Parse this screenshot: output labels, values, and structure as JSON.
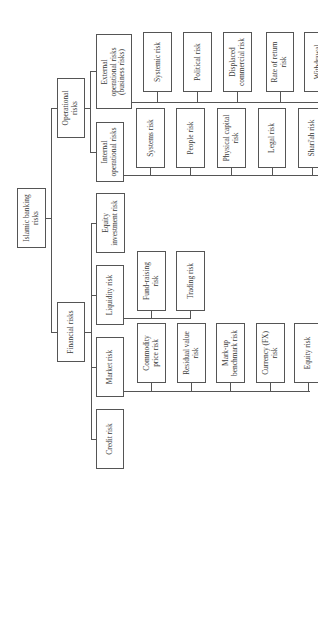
{
  "diagram": {
    "root": "Islamic banking\nrisks",
    "operational": {
      "label": "Operational\nrisks",
      "external": {
        "label": "External\noperational risks\n(business risks)",
        "children": [
          "Systemic risk",
          "Political risk",
          "Displaced\ncommercial risk",
          "Rate of return\nrisk",
          "Withdrawal"
        ]
      },
      "internal": {
        "label": "Internal\noperational risks",
        "children": [
          "Systems risk",
          "People risk",
          "Physical capital\nrisk",
          "Legal risk",
          "Shari'ah risk"
        ]
      }
    },
    "financial": {
      "label": "Financial risks",
      "equity_investment": "Equity\ninvestment risk",
      "liquidity": {
        "label": "Liquidity risk",
        "children": [
          "Fund-raising\nrisk",
          "Trading risk"
        ]
      },
      "market": {
        "label": "Market risk",
        "children": [
          "Commodity\nprice risk",
          "Residual value\nrisk",
          "Mark-up\nbenchmark risk",
          "Currency (FX)\nrisk",
          "Equity risk"
        ]
      },
      "credit": "Credit risk"
    }
  }
}
